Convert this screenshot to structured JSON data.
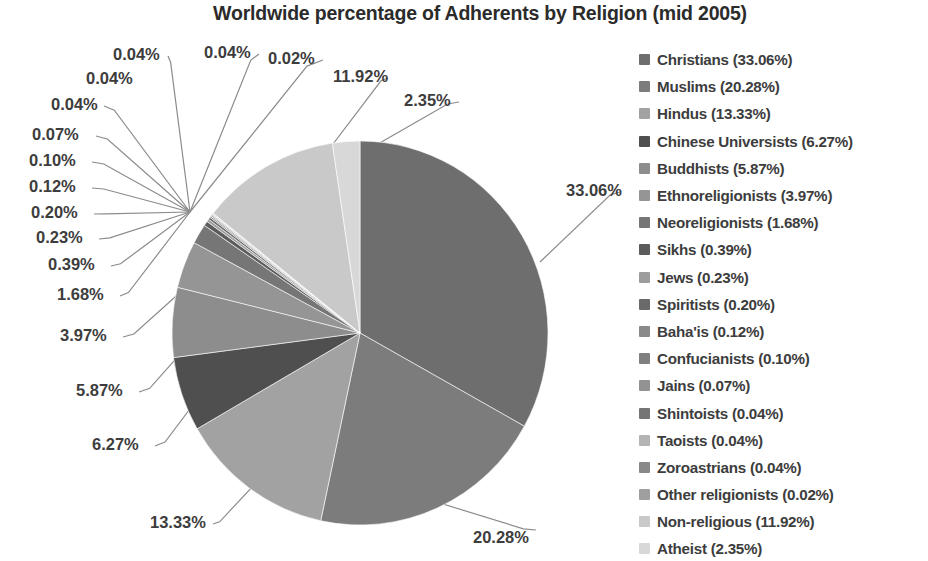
{
  "chart_data": {
    "type": "pie",
    "title": "Worldwide percentage of Adherents by Religion (mid 2005)",
    "xlabel": "",
    "ylabel": "",
    "legend_position": "right",
    "grid": false,
    "start_angle_deg": 0,
    "direction": "clockwise",
    "units": "percent",
    "categories": [
      "Christians",
      "Muslims",
      "Hindus",
      "Chinese Universists",
      "Buddhists",
      "Ethnoreligionists",
      "Neoreligionists",
      "Sikhs",
      "Jews",
      "Spiritists",
      "Baha'is",
      "Confucianists",
      "Jains",
      "Shintoists",
      "Taoists",
      "Zoroastrians",
      "Other religionists",
      "Non-religious",
      "Atheist"
    ],
    "values": [
      33.06,
      20.28,
      13.33,
      6.27,
      5.87,
      3.97,
      1.68,
      0.39,
      0.23,
      0.2,
      0.12,
      0.1,
      0.07,
      0.04,
      0.04,
      0.04,
      0.02,
      11.92,
      2.35
    ],
    "colors": [
      "#6e6e6e",
      "#7c7c7c",
      "#a2a2a2",
      "#4f4f4f",
      "#8d8d8d",
      "#959595",
      "#767676",
      "#5c5c5c",
      "#9c9c9c",
      "#6a6a6a",
      "#8a8a8a",
      "#7f7f7f",
      "#929292",
      "#757575",
      "#b4b4b4",
      "#888888",
      "#9f9f9f",
      "#c9c9c9",
      "#d8d8d8"
    ],
    "slice_labels": [
      "33.06%",
      "20.28%",
      "13.33%",
      "6.27%",
      "5.87%",
      "3.97%",
      "1.68%",
      "0.39%",
      "0.23%",
      "0.20%",
      "0.12%",
      "0.10%",
      "0.07%",
      "0.04%",
      "0.04%",
      "0.04%",
      "0.02%",
      "11.92%",
      "2.35%"
    ]
  },
  "legend": {
    "items": [
      {
        "label": "Christians (33.06%)",
        "color": "#6e6e6e"
      },
      {
        "label": "Muslims (20.28%)",
        "color": "#7c7c7c"
      },
      {
        "label": "Hindus (13.33%)",
        "color": "#a2a2a2"
      },
      {
        "label": "Chinese Universists (6.27%)",
        "color": "#4f4f4f"
      },
      {
        "label": "Buddhists (5.87%)",
        "color": "#8d8d8d"
      },
      {
        "label": "Ethnoreligionists (3.97%)",
        "color": "#959595"
      },
      {
        "label": "Neoreligionists (1.68%)",
        "color": "#767676"
      },
      {
        "label": "Sikhs (0.39%)",
        "color": "#5c5c5c"
      },
      {
        "label": "Jews (0.23%)",
        "color": "#9c9c9c"
      },
      {
        "label": "Spiritists (0.20%)",
        "color": "#6a6a6a"
      },
      {
        "label": "Baha'is (0.12%)",
        "color": "#8a8a8a"
      },
      {
        "label": "Confucianists (0.10%)",
        "color": "#7f7f7f"
      },
      {
        "label": "Jains (0.07%)",
        "color": "#929292"
      },
      {
        "label": "Shintoists (0.04%)",
        "color": "#757575"
      },
      {
        "label": "Taoists (0.04%)",
        "color": "#b4b4b4"
      },
      {
        "label": "Zoroastrians (0.04%)",
        "color": "#888888"
      },
      {
        "label": "Other religionists (0.02%)",
        "color": "#9f9f9f"
      },
      {
        "label": "Non-religious (11.92%)",
        "color": "#c9c9c9"
      },
      {
        "label": "Atheist (2.35%)",
        "color": "#d8d8d8"
      }
    ]
  },
  "callouts": [
    {
      "text": "0.04%",
      "x": 113,
      "y": 60
    },
    {
      "text": "0.04%",
      "x": 204,
      "y": 58
    },
    {
      "text": "0.02%",
      "x": 268,
      "y": 64
    },
    {
      "text": "11.92%",
      "x": 333,
      "y": 82
    },
    {
      "text": "2.35%",
      "x": 404,
      "y": 106
    },
    {
      "text": "33.06%",
      "x": 566,
      "y": 196
    },
    {
      "text": "20.28%",
      "x": 473,
      "y": 543
    },
    {
      "text": "13.33%",
      "x": 150,
      "y": 528
    },
    {
      "text": "6.27%",
      "x": 92,
      "y": 450
    },
    {
      "text": "5.87%",
      "x": 76,
      "y": 396
    },
    {
      "text": "3.97%",
      "x": 60,
      "y": 341
    },
    {
      "text": "1.68%",
      "x": 57,
      "y": 300
    },
    {
      "text": "0.39%",
      "x": 48,
      "y": 270
    },
    {
      "text": "0.23%",
      "x": 36,
      "y": 243
    },
    {
      "text": "0.20%",
      "x": 31,
      "y": 218
    },
    {
      "text": "0.12%",
      "x": 29,
      "y": 192
    },
    {
      "text": "0.10%",
      "x": 29,
      "y": 166
    },
    {
      "text": "0.07%",
      "x": 32,
      "y": 140
    },
    {
      "text": "0.04%",
      "x": 51,
      "y": 110
    },
    {
      "text": "0.04%",
      "x": 86,
      "y": 84
    }
  ],
  "geometry": {
    "center_x": 360,
    "center_y": 333,
    "radius_x": 188,
    "radius_y": 192
  }
}
